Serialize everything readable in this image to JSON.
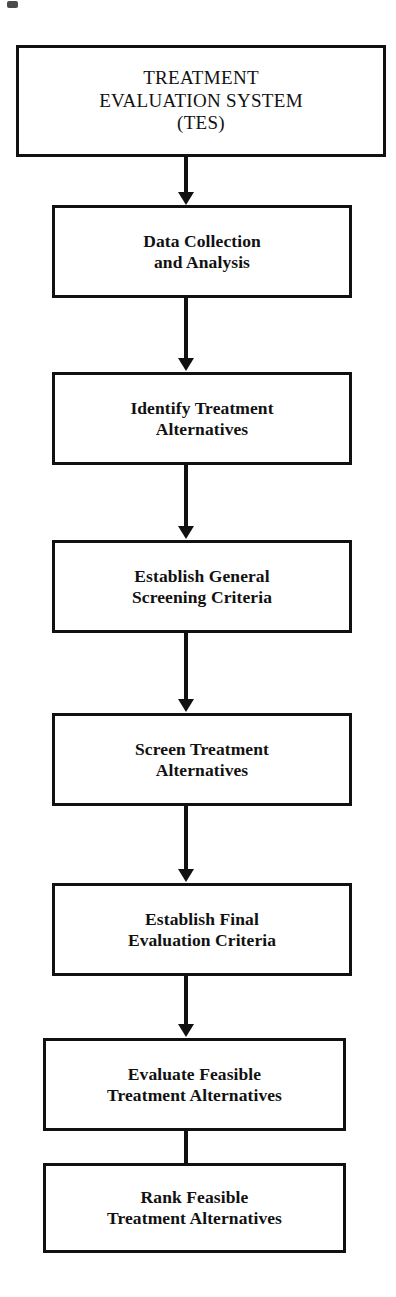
{
  "diagram": {
    "type": "flowchart",
    "orientation": "top-to-bottom",
    "stroke_color": "#111111",
    "fill_color": "#ffffff",
    "nodes": [
      {
        "id": "tes",
        "label": "TREATMENT\nEVALUATION SYSTEM\n(TES)",
        "style": "root"
      },
      {
        "id": "data",
        "label": "Data Collection\nand Analysis",
        "style": "step"
      },
      {
        "id": "identify",
        "label": "Identify Treatment\nAlternatives",
        "style": "step"
      },
      {
        "id": "general",
        "label": "Establish General\nScreening Criteria",
        "style": "step"
      },
      {
        "id": "screen",
        "label": "Screen Treatment\nAlternatives",
        "style": "step"
      },
      {
        "id": "final",
        "label": "Establish Final\nEvaluation Criteria",
        "style": "step"
      },
      {
        "id": "evaluate",
        "label": "Evaluate Feasible\nTreatment Alternatives",
        "style": "step"
      },
      {
        "id": "rank",
        "label": "Rank Feasible\nTreatment Alternatives",
        "style": "step"
      }
    ],
    "edges": [
      {
        "from": "tes",
        "to": "data",
        "arrow": "down"
      },
      {
        "from": "data",
        "to": "identify",
        "arrow": "down"
      },
      {
        "from": "identify",
        "to": "general",
        "arrow": "down"
      },
      {
        "from": "general",
        "to": "screen",
        "arrow": "down"
      },
      {
        "from": "screen",
        "to": "final",
        "arrow": "down"
      },
      {
        "from": "final",
        "to": "evaluate",
        "arrow": "down"
      },
      {
        "from": "evaluate",
        "to": "rank",
        "arrow": "down"
      }
    ]
  }
}
